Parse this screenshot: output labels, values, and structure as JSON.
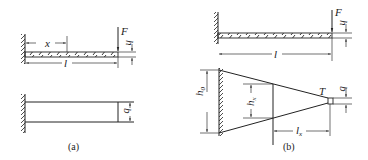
{
  "figure": {
    "panel_a": {
      "caption": "(a)",
      "labels": {
        "x": "x",
        "l": "l",
        "F": "F",
        "h": "h",
        "b": "b"
      }
    },
    "panel_b": {
      "caption": "(b)",
      "labels": {
        "l": "l",
        "F": "F",
        "h": "h",
        "h0": "h",
        "h0_sub": "0",
        "hx": "h",
        "hx_sub": "x",
        "lx": "l",
        "lx_sub": "x",
        "T": "T",
        "b": "b"
      }
    },
    "colors": {
      "line": "#222222",
      "background": "#ffffff"
    }
  }
}
